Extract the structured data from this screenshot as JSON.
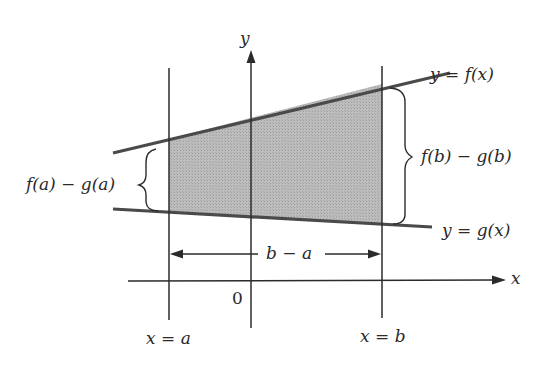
{
  "diagram": {
    "colors": {
      "line": "#3a3a3a",
      "curve": "#4a4a4a",
      "shade": "#b4b4b4",
      "text": "#2a2a2a"
    },
    "labels": {
      "y_axis": "y",
      "x_axis": "x",
      "origin": "0",
      "f_curve": "y = f(x)",
      "g_curve": "y = g(x)",
      "height_a": "f(a) − g(a)",
      "height_b": "f(b) − g(b)",
      "width": "b − a",
      "x_eq_a": "x = a",
      "x_eq_b": "x = b"
    }
  }
}
